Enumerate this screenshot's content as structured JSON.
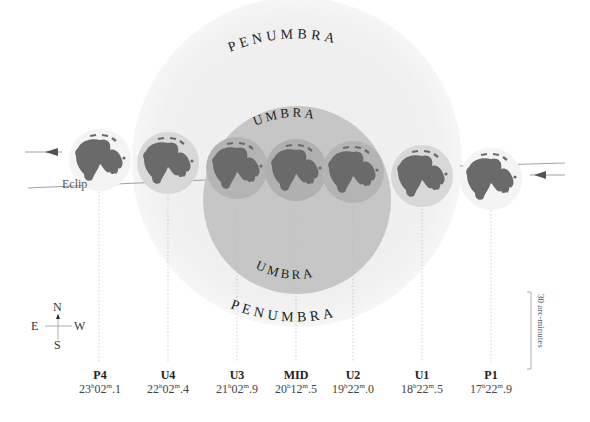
{
  "diagram": {
    "shadow_labels": {
      "penumbra_top": "PENUMBRA",
      "penumbra_bottom": "PENUMBRA",
      "umbra_top": "UMBRA",
      "umbra_bottom": "UMBRA"
    },
    "ecliptic_label": "Eclip",
    "colors": {
      "penumbra": "#f1f1f1",
      "umbra": "#c4c4c4",
      "moon_base": "#dddddd",
      "maria": "#6a6a6a",
      "line": "#888888"
    },
    "compass": {
      "north": "N",
      "south": "S",
      "east": "E",
      "west": "W"
    },
    "scale_bar": {
      "label": "30 arc-minutes"
    },
    "contacts": [
      {
        "id": "P4",
        "name": "P4",
        "hours": "23",
        "minutes": "02",
        "decimal": "1"
      },
      {
        "id": "U4",
        "name": "U4",
        "hours": "22",
        "minutes": "02",
        "decimal": "4"
      },
      {
        "id": "U3",
        "name": "U3",
        "hours": "21",
        "minutes": "02",
        "decimal": "9"
      },
      {
        "id": "MID",
        "name": "MID",
        "hours": "20",
        "minutes": "12",
        "decimal": "5"
      },
      {
        "id": "U2",
        "name": "U2",
        "hours": "19",
        "minutes": "22",
        "decimal": "0"
      },
      {
        "id": "U1",
        "name": "U1",
        "hours": "18",
        "minutes": "22",
        "decimal": "5"
      },
      {
        "id": "P1",
        "name": "P1",
        "hours": "17",
        "minutes": "22",
        "decimal": "9"
      }
    ]
  }
}
